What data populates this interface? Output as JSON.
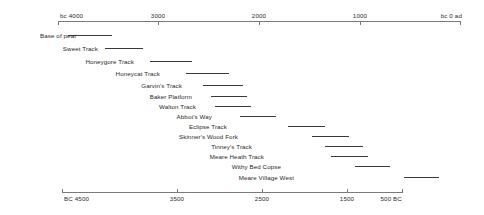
{
  "chart_data": {
    "type": "bar",
    "orientation": "horizontal",
    "subtype": "timeline-range",
    "title": "",
    "xlabel": "",
    "ylabel": "",
    "grid": false,
    "legend": null,
    "axes": [
      {
        "name": "top-axis",
        "position": "top",
        "start_label": "bc 4000",
        "end_label": "bc 0 ad",
        "ticks": [
          {
            "label": "bc 4000",
            "value": 4000,
            "anchor": "start"
          },
          {
            "label": "3000",
            "value": 3000,
            "anchor": "middle"
          },
          {
            "label": "2000",
            "value": 2000,
            "anchor": "middle"
          },
          {
            "label": "1000",
            "value": 1000,
            "anchor": "middle"
          },
          {
            "label": "bc 0 ad",
            "value": 0,
            "anchor": "end"
          }
        ],
        "range": [
          4000,
          0
        ]
      },
      {
        "name": "bottom-axis",
        "position": "bottom",
        "start_label": "BC 4500",
        "end_label": "500 BC",
        "ticks": [
          {
            "label": "BC 4500",
            "value": 4500,
            "anchor": "start"
          },
          {
            "label": "3500",
            "value": 3500,
            "anchor": "middle"
          },
          {
            "label": "2500",
            "value": 2500,
            "anchor": "middle"
          },
          {
            "label": "1500",
            "value": 1500,
            "anchor": "middle"
          },
          {
            "label": "500 BC",
            "value": 500,
            "anchor": "end"
          }
        ],
        "range": [
          4500,
          500
        ]
      }
    ],
    "categories": [
      "Base of peat",
      "Sweet Track",
      "Honeygore Track",
      "Honeycat Track",
      "Garvin's Track",
      "Baker Platform",
      "Walton Track",
      "Abbot's Way",
      "Eclipse Track",
      "Skinner's Wood Fork",
      "Tinney's Track",
      "Meare Heath Track",
      "Withy Bed Copse",
      "Meare Village West"
    ],
    "ranges": [
      {
        "label": "Base of peat",
        "start_bc": 4400,
        "end_bc": 3980
      },
      {
        "label": "Sweet Track",
        "start_bc": 3980,
        "end_bc": 3640
      },
      {
        "label": "Honeygore Track",
        "start_bc": 3620,
        "end_bc": 3180
      },
      {
        "label": "Honeycat Track",
        "start_bc": 3120,
        "end_bc": 2660
      },
      {
        "label": "Garvin's Track",
        "start_bc": 2700,
        "end_bc": 2320
      },
      {
        "label": "Baker Platform",
        "start_bc": 2600,
        "end_bc": 2260
      },
      {
        "label": "Walton Track",
        "start_bc": 2560,
        "end_bc": 2180
      },
      {
        "label": "Abbot's Way",
        "start_bc": 2280,
        "end_bc": 1940
      },
      {
        "label": "Eclipse Track",
        "start_bc": 1820,
        "end_bc": 1460
      },
      {
        "label": "Skinner's Wood Fork",
        "start_bc": 1560,
        "end_bc": 1200
      },
      {
        "label": "Tinney's Track",
        "start_bc": 1460,
        "end_bc": 1060
      },
      {
        "label": "Meare Heath Track",
        "start_bc": 1400,
        "end_bc": 1020
      },
      {
        "label": "Withy Bed Copse",
        "start_bc": 1180,
        "end_bc": 820
      },
      {
        "label": "Meare Village West",
        "start_bc": 700,
        "end_bc": 340
      }
    ]
  },
  "layout": {
    "rows": [
      {
        "label_x": 76,
        "row_y": 30,
        "bar_x": 68,
        "bar_w": 44
      },
      {
        "label_x": 98,
        "row_y": 43,
        "bar_x": 105,
        "bar_w": 38
      },
      {
        "label_x": 134,
        "row_y": 56,
        "bar_x": 150,
        "bar_w": 42
      },
      {
        "label_x": 160,
        "row_y": 68,
        "bar_x": 186,
        "bar_w": 43
      },
      {
        "label_x": 182,
        "row_y": 80,
        "bar_x": 203,
        "bar_w": 40
      },
      {
        "label_x": 192,
        "row_y": 91,
        "bar_x": 211,
        "bar_w": 36
      },
      {
        "label_x": 196,
        "row_y": 101,
        "bar_x": 215,
        "bar_w": 36
      },
      {
        "label_x": 212,
        "row_y": 111,
        "bar_x": 240,
        "bar_w": 36
      },
      {
        "label_x": 227,
        "row_y": 121,
        "bar_x": 288,
        "bar_w": 37
      },
      {
        "label_x": 238,
        "row_y": 131,
        "bar_x": 312,
        "bar_w": 37
      },
      {
        "label_x": 252,
        "row_y": 141,
        "bar_x": 325,
        "bar_w": 38
      },
      {
        "label_x": 264,
        "row_y": 151,
        "bar_x": 331,
        "bar_w": 37
      },
      {
        "label_x": 281,
        "row_y": 161,
        "bar_x": 355,
        "bar_w": 35
      },
      {
        "label_x": 294,
        "row_y": 172,
        "bar_x": 404,
        "bar_w": 35
      }
    ],
    "axis_top": {
      "line_x": 58,
      "line_w": 402,
      "tick_px": [
        58,
        158,
        259,
        360,
        460
      ]
    },
    "axis_bottom": {
      "line_x": 62,
      "line_w": 340,
      "tick_px": [
        62,
        177,
        262,
        347,
        402
      ]
    },
    "label_px": {
      "top": [
        60,
        158,
        259,
        360,
        462
      ],
      "bottom": [
        64,
        177,
        262,
        347,
        402
      ]
    }
  }
}
